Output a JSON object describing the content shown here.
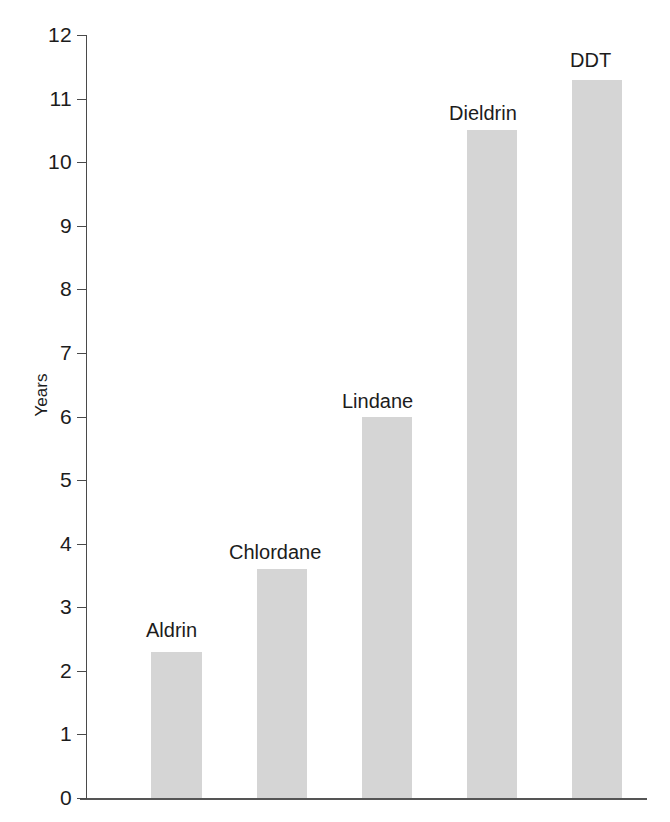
{
  "chart_data": {
    "type": "bar",
    "title": "",
    "subtitle": "",
    "xlabel": "",
    "ylabel": "Years",
    "ylim": [
      0,
      12
    ],
    "xlim": [
      0,
      6
    ],
    "grid": false,
    "legend": "none",
    "orientation": "vertical",
    "bar_color": "#d5d5d5",
    "axis_color": "#4a4a4a",
    "text_color": "#1c1c1c",
    "background_color": "#ffffff",
    "categories": [
      "Aldrin",
      "Chlordane",
      "Lindane",
      "Dieldrin",
      "DDT"
    ],
    "values": [
      2.3,
      3.6,
      6.0,
      10.5,
      11.3
    ],
    "value_labels_shown": false,
    "category_labels_position": "above-bar",
    "ytick_labels": [
      "0",
      "1",
      "2",
      "3",
      "4",
      "5",
      "6",
      "7",
      "8",
      "9",
      "10",
      "11",
      "12"
    ],
    "ytick_values": [
      0,
      1,
      2,
      3,
      4,
      5,
      6,
      7,
      8,
      9,
      10,
      11,
      12
    ],
    "xtick_labels": [],
    "bars": [
      {
        "label": "Aldrin",
        "value": 2.3,
        "left": 151,
        "width": 51,
        "label_left": 146,
        "label_top": 619
      },
      {
        "label": "Chlordane",
        "value": 3.6,
        "left": 257,
        "width": 50,
        "label_left": 229,
        "label_top": 541
      },
      {
        "label": "Lindane",
        "value": 6.0,
        "left": 362,
        "width": 50,
        "label_left": 342,
        "label_top": 390
      },
      {
        "label": "Dieldrin",
        "value": 10.5,
        "left": 467,
        "width": 50,
        "label_left": 449,
        "label_top": 102
      },
      {
        "label": "DDT",
        "value": 11.3,
        "left": 572,
        "width": 50,
        "label_left": 570,
        "label_top": 49
      }
    ]
  }
}
